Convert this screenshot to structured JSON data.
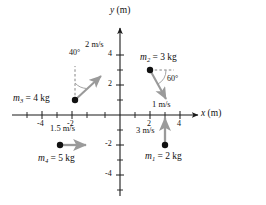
{
  "figure": {
    "type": "physics-vector-diagram"
  },
  "axes": {
    "x_label": "x",
    "x_unit": "(m)",
    "y_label": "y",
    "y_unit": "(m)",
    "x_ticks": [
      "-4",
      "-2",
      "2",
      "4"
    ],
    "y_ticks": [
      "4",
      "2",
      "-2",
      "-4"
    ],
    "x_range": [
      -5.5,
      5.5
    ],
    "y_range": [
      -5,
      5
    ],
    "origin_label": ""
  },
  "bodies": [
    {
      "id": "m1",
      "mass_label": "m",
      "mass_sub": "1",
      "mass_value": "= 2 kg",
      "position": [
        3,
        -2
      ],
      "speed_label": "3 m/s",
      "direction_deg": 90,
      "vector_length_units": 2
    },
    {
      "id": "m2",
      "mass_label": "m",
      "mass_sub": "2",
      "mass_value": "= 3 kg",
      "position": [
        2,
        3
      ],
      "speed_label": "1 m/s",
      "angle_label": "60",
      "angle_unit": "°",
      "direction_deg": 240,
      "vector_length_units": 2.1,
      "reference": "dashed horizontal to the right"
    },
    {
      "id": "m3",
      "mass_label": "m",
      "mass_sub": "3",
      "mass_value": "= 4 kg",
      "position": [
        -3,
        1
      ],
      "speed_label": "2 m/s",
      "angle_label": "40",
      "angle_unit": "°",
      "direction_deg": 50,
      "vector_length_units": 2.3,
      "reference": "dashed vertical upward"
    },
    {
      "id": "m4",
      "mass_label": "m",
      "mass_sub": "4",
      "mass_value": "= 5 kg",
      "position": [
        -4,
        -2
      ],
      "speed_label": "1.5 m/s",
      "direction_deg": 0,
      "vector_length_units": 1.7
    }
  ],
  "colors": {
    "axis": "#1a1a1a",
    "vector": "#9a9a9a",
    "dot": "#111111",
    "dashed": "#777777",
    "text": "#111111",
    "background": "#ffffff"
  }
}
